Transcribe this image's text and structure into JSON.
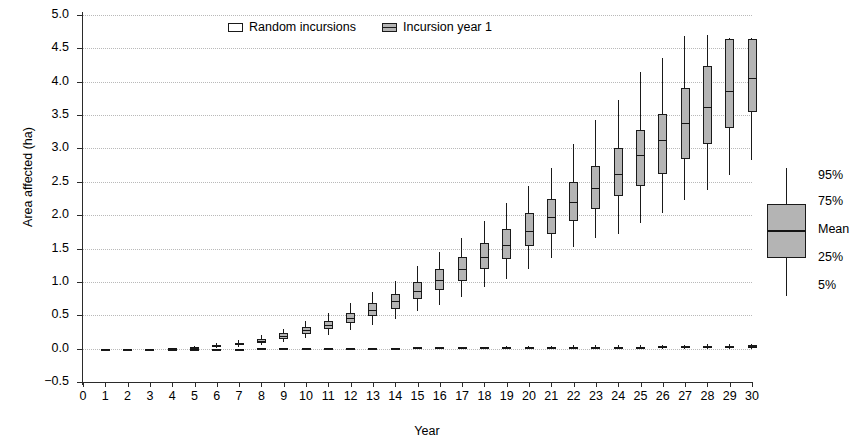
{
  "chart_data": {
    "type": "box",
    "title": "",
    "xlabel": "Year",
    "ylabel": "Area affected (ha)",
    "ylim": [
      -0.5,
      5.0
    ],
    "ytick_labels": [
      "5.0",
      "4.5",
      "4.0",
      "3.5",
      "3.0",
      "2.5",
      "2.0",
      "1.5",
      "1.0",
      "0.5",
      "0.0",
      "−0.5"
    ],
    "ytick_values": [
      5.0,
      4.5,
      4.0,
      3.5,
      3.0,
      2.5,
      2.0,
      1.5,
      1.0,
      0.5,
      0.0,
      -0.5
    ],
    "xlim": [
      0,
      30
    ],
    "xtick_labels": [
      "0",
      "1",
      "2",
      "3",
      "4",
      "5",
      "6",
      "7",
      "8",
      "9",
      "10",
      "11",
      "12",
      "13",
      "14",
      "15",
      "16",
      "17",
      "18",
      "19",
      "20",
      "21",
      "22",
      "23",
      "24",
      "25",
      "26",
      "27",
      "28",
      "29",
      "30"
    ],
    "grid": "horizontal-dotted",
    "legend_position": "top-center",
    "series": [
      {
        "name": "Random incursions",
        "fill": "#ffffff",
        "boxes": [
          {
            "x": 1,
            "p5": 0.0,
            "p25": 0.0,
            "mean": 0.0,
            "p75": 0.0,
            "p95": 0.0
          },
          {
            "x": 2,
            "p5": 0.0,
            "p25": 0.0,
            "mean": 0.0,
            "p75": 0.0,
            "p95": 0.0
          },
          {
            "x": 3,
            "p5": 0.0,
            "p25": 0.0,
            "mean": 0.0,
            "p75": 0.0,
            "p95": 0.0
          },
          {
            "x": 4,
            "p5": 0.0,
            "p25": 0.0,
            "mean": 0.0,
            "p75": 0.0,
            "p95": 0.0
          },
          {
            "x": 5,
            "p5": 0.0,
            "p25": 0.0,
            "mean": 0.0,
            "p75": 0.0,
            "p95": 0.01
          },
          {
            "x": 6,
            "p5": 0.0,
            "p25": 0.0,
            "mean": 0.0,
            "p75": 0.0,
            "p95": 0.01
          },
          {
            "x": 7,
            "p5": 0.0,
            "p25": 0.0,
            "mean": 0.0,
            "p75": 0.0,
            "p95": 0.01
          },
          {
            "x": 8,
            "p5": 0.0,
            "p25": 0.0,
            "mean": 0.01,
            "p75": 0.01,
            "p95": 0.01
          },
          {
            "x": 9,
            "p5": 0.0,
            "p25": 0.0,
            "mean": 0.01,
            "p75": 0.01,
            "p95": 0.01
          },
          {
            "x": 10,
            "p5": 0.0,
            "p25": 0.0,
            "mean": 0.01,
            "p75": 0.01,
            "p95": 0.02
          },
          {
            "x": 11,
            "p5": 0.0,
            "p25": 0.0,
            "mean": 0.01,
            "p75": 0.01,
            "p95": 0.02
          },
          {
            "x": 12,
            "p5": 0.0,
            "p25": 0.0,
            "mean": 0.01,
            "p75": 0.01,
            "p95": 0.02
          },
          {
            "x": 13,
            "p5": 0.0,
            "p25": 0.0,
            "mean": 0.01,
            "p75": 0.01,
            "p95": 0.02
          },
          {
            "x": 14,
            "p5": 0.0,
            "p25": 0.0,
            "mean": 0.01,
            "p75": 0.01,
            "p95": 0.02
          },
          {
            "x": 15,
            "p5": 0.0,
            "p25": 0.0,
            "mean": 0.01,
            "p75": 0.02,
            "p95": 0.03
          },
          {
            "x": 16,
            "p5": 0.0,
            "p25": 0.01,
            "mean": 0.01,
            "p75": 0.02,
            "p95": 0.03
          },
          {
            "x": 17,
            "p5": 0.0,
            "p25": 0.01,
            "mean": 0.01,
            "p75": 0.02,
            "p95": 0.03
          },
          {
            "x": 18,
            "p5": 0.0,
            "p25": 0.01,
            "mean": 0.02,
            "p75": 0.02,
            "p95": 0.03
          },
          {
            "x": 19,
            "p5": 0.0,
            "p25": 0.01,
            "mean": 0.02,
            "p75": 0.02,
            "p95": 0.04
          },
          {
            "x": 20,
            "p5": 0.0,
            "p25": 0.01,
            "mean": 0.02,
            "p75": 0.02,
            "p95": 0.04
          },
          {
            "x": 21,
            "p5": 0.0,
            "p25": 0.01,
            "mean": 0.02,
            "p75": 0.03,
            "p95": 0.04
          },
          {
            "x": 22,
            "p5": 0.0,
            "p25": 0.01,
            "mean": 0.02,
            "p75": 0.03,
            "p95": 0.05
          },
          {
            "x": 23,
            "p5": 0.0,
            "p25": 0.01,
            "mean": 0.02,
            "p75": 0.03,
            "p95": 0.05
          },
          {
            "x": 24,
            "p5": 0.0,
            "p25": 0.01,
            "mean": 0.02,
            "p75": 0.03,
            "p95": 0.05
          },
          {
            "x": 25,
            "p5": 0.0,
            "p25": 0.01,
            "mean": 0.03,
            "p75": 0.03,
            "p95": 0.06
          },
          {
            "x": 26,
            "p5": 0.0,
            "p25": 0.01,
            "mean": 0.03,
            "p75": 0.04,
            "p95": 0.06
          },
          {
            "x": 27,
            "p5": 0.0,
            "p25": 0.01,
            "mean": 0.03,
            "p75": 0.04,
            "p95": 0.06
          },
          {
            "x": 28,
            "p5": 0.0,
            "p25": 0.02,
            "mean": 0.03,
            "p75": 0.04,
            "p95": 0.07
          },
          {
            "x": 29,
            "p5": 0.0,
            "p25": 0.02,
            "mean": 0.03,
            "p75": 0.04,
            "p95": 0.07
          },
          {
            "x": 30,
            "p5": 0.0,
            "p25": 0.02,
            "mean": 0.03,
            "p75": 0.05,
            "p95": 0.07
          }
        ]
      },
      {
        "name": "Incursion year 1",
        "fill": "#b4b4b4",
        "boxes": [
          {
            "x": 1,
            "p5": 0.0,
            "p25": 0.0,
            "mean": 0.0,
            "p75": 0.0,
            "p95": 0.0
          },
          {
            "x": 2,
            "p5": 0.0,
            "p25": 0.0,
            "mean": 0.0,
            "p75": 0.0,
            "p95": 0.0
          },
          {
            "x": 3,
            "p5": 0.0,
            "p25": 0.0,
            "mean": 0.0,
            "p75": 0.0,
            "p95": 0.01
          },
          {
            "x": 4,
            "p5": 0.0,
            "p25": 0.0,
            "mean": 0.01,
            "p75": 0.01,
            "p95": 0.02
          },
          {
            "x": 5,
            "p5": 0.0,
            "p25": 0.01,
            "mean": 0.02,
            "p75": 0.02,
            "p95": 0.04
          },
          {
            "x": 6,
            "p5": 0.01,
            "p25": 0.02,
            "mean": 0.04,
            "p75": 0.05,
            "p95": 0.08
          },
          {
            "x": 7,
            "p5": 0.03,
            "p25": 0.05,
            "mean": 0.07,
            "p75": 0.09,
            "p95": 0.13
          },
          {
            "x": 8,
            "p5": 0.06,
            "p25": 0.09,
            "mean": 0.12,
            "p75": 0.15,
            "p95": 0.2
          },
          {
            "x": 9,
            "p5": 0.1,
            "p25": 0.15,
            "mean": 0.19,
            "p75": 0.23,
            "p95": 0.3
          },
          {
            "x": 10,
            "p5": 0.16,
            "p25": 0.22,
            "mean": 0.28,
            "p75": 0.33,
            "p95": 0.42
          },
          {
            "x": 11,
            "p5": 0.21,
            "p25": 0.29,
            "mean": 0.35,
            "p75": 0.42,
            "p95": 0.54
          },
          {
            "x": 12,
            "p5": 0.28,
            "p25": 0.38,
            "mean": 0.46,
            "p75": 0.54,
            "p95": 0.68
          },
          {
            "x": 13,
            "p5": 0.36,
            "p25": 0.49,
            "mean": 0.58,
            "p75": 0.68,
            "p95": 0.85
          },
          {
            "x": 14,
            "p5": 0.45,
            "p25": 0.6,
            "mean": 0.71,
            "p75": 0.82,
            "p95": 1.02
          },
          {
            "x": 15,
            "p5": 0.56,
            "p25": 0.74,
            "mean": 0.87,
            "p75": 1.0,
            "p95": 1.24
          },
          {
            "x": 16,
            "p5": 0.66,
            "p25": 0.88,
            "mean": 1.03,
            "p75": 1.19,
            "p95": 1.45
          },
          {
            "x": 17,
            "p5": 0.78,
            "p25": 1.02,
            "mean": 1.19,
            "p75": 1.37,
            "p95": 1.66
          },
          {
            "x": 18,
            "p5": 0.92,
            "p25": 1.19,
            "mean": 1.37,
            "p75": 1.58,
            "p95": 1.92
          },
          {
            "x": 19,
            "p5": 1.05,
            "p25": 1.35,
            "mean": 1.56,
            "p75": 1.8,
            "p95": 2.18
          },
          {
            "x": 20,
            "p5": 1.2,
            "p25": 1.54,
            "mean": 1.77,
            "p75": 2.03,
            "p95": 2.44
          },
          {
            "x": 21,
            "p5": 1.36,
            "p25": 1.72,
            "mean": 1.97,
            "p75": 2.25,
            "p95": 2.7
          },
          {
            "x": 22,
            "p5": 1.52,
            "p25": 1.92,
            "mean": 2.2,
            "p75": 2.5,
            "p95": 3.06
          },
          {
            "x": 23,
            "p5": 1.66,
            "p25": 2.1,
            "mean": 2.4,
            "p75": 2.74,
            "p95": 3.42
          },
          {
            "x": 24,
            "p5": 1.72,
            "p25": 2.28,
            "mean": 2.62,
            "p75": 3.0,
            "p95": 3.72
          },
          {
            "x": 25,
            "p5": 1.88,
            "p25": 2.44,
            "mean": 2.9,
            "p75": 3.28,
            "p95": 4.14
          },
          {
            "x": 26,
            "p5": 2.04,
            "p25": 2.62,
            "mean": 3.12,
            "p75": 3.52,
            "p95": 4.36
          },
          {
            "x": 27,
            "p5": 2.22,
            "p25": 2.84,
            "mean": 3.38,
            "p75": 3.9,
            "p95": 4.68
          },
          {
            "x": 28,
            "p5": 2.38,
            "p25": 3.06,
            "mean": 3.62,
            "p75": 4.24,
            "p95": 4.7
          },
          {
            "x": 29,
            "p5": 2.6,
            "p25": 3.3,
            "mean": 3.86,
            "p75": 4.64,
            "p95": 4.66
          },
          {
            "x": 30,
            "p5": 2.82,
            "p25": 3.54,
            "mean": 4.06,
            "p75": 4.64,
            "p95": 4.66
          }
        ]
      }
    ]
  },
  "legend": {
    "items": [
      {
        "label": "Random incursions",
        "style": "open"
      },
      {
        "label": "Incursion year 1",
        "style": "filled"
      }
    ]
  },
  "key": {
    "labels": [
      "95%",
      "75%",
      "Mean",
      "25%",
      "5%"
    ]
  }
}
